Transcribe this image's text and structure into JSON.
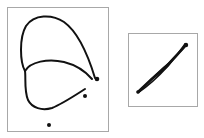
{
  "figure": {
    "panels": [
      {
        "id": "left",
        "description": "hand-drawn closed loop figure with three dots",
        "stroke_color": "#111111",
        "dots": [
          {
            "x": 97,
            "y": 79
          },
          {
            "x": 85,
            "y": 96
          },
          {
            "x": 49,
            "y": 125
          }
        ]
      },
      {
        "id": "right",
        "description": "hand-drawn elongated diagonal loop",
        "stroke_color": "#111111"
      }
    ],
    "border_color": "#a8a8a8"
  }
}
